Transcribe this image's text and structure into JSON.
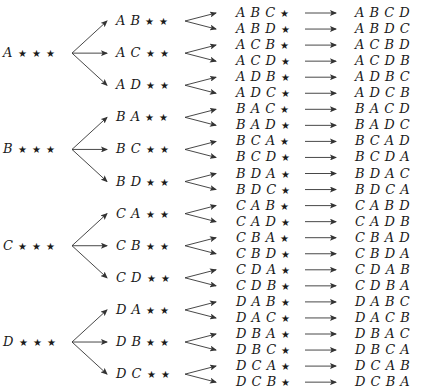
{
  "diagram": {
    "type": "tree",
    "star_symbol": "★",
    "levels": [
      {
        "name": "first-letter",
        "nodes": [
          "A",
          "B",
          "C",
          "D"
        ]
      },
      {
        "name": "first-two-letters",
        "nodes": [
          "AB",
          "AC",
          "AD",
          "BA",
          "BC",
          "BD",
          "CA",
          "CB",
          "CD",
          "DA",
          "DB",
          "DC"
        ]
      },
      {
        "name": "first-three-letters",
        "nodes": [
          "ABC",
          "ABD",
          "ACB",
          "ACD",
          "ADB",
          "ADC",
          "BAC",
          "BAD",
          "BCA",
          "BCD",
          "BDA",
          "BDC",
          "CAB",
          "CAD",
          "CBA",
          "CBD",
          "CDA",
          "CDB",
          "DAB",
          "DAC",
          "DBA",
          "DBC",
          "DCA",
          "DCB"
        ]
      },
      {
        "name": "full-permutation",
        "nodes": [
          "ABCD",
          "ABDC",
          "ACBD",
          "ACDB",
          "ADBC",
          "ADCB",
          "BACD",
          "BADC",
          "BCAD",
          "BCDA",
          "BDAC",
          "BDCA",
          "CABD",
          "CADB",
          "CBAD",
          "CBDA",
          "CDAB",
          "CDBA",
          "DABC",
          "DACB",
          "DBAC",
          "DBCA",
          "DCAB",
          "DCBA"
        ]
      }
    ],
    "edge_color": "#333333",
    "text_color": "#1a1a1a"
  }
}
